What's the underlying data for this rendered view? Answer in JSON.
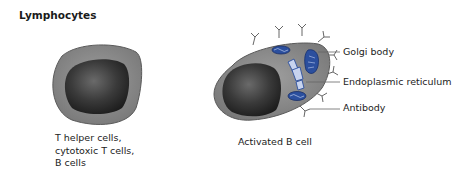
{
  "title": "Lymphocytes",
  "cells": [
    {
      "name": "resting-lymphocyte",
      "caption_lines": [
        "T helper cells,",
        "cytotoxic T cells,",
        "B cells"
      ]
    },
    {
      "name": "activated-b-cell",
      "caption_lines": [
        "Activated B cell"
      ],
      "labels": [
        "Golgi body",
        "Endoplasmic reticulum",
        "Antibody"
      ]
    }
  ],
  "colors": {
    "cytoplasm": "#8a8a8a",
    "nucleus": "#2e2e2e",
    "organelle_blue": "#2b4f9e",
    "outline": "#555555"
  }
}
